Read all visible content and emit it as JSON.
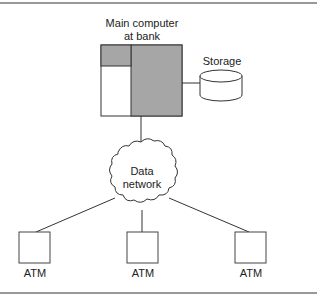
{
  "diagram": {
    "type": "network-topology",
    "nodes": {
      "main_computer": {
        "label_line1": "Main computer",
        "label_line2": "at bank"
      },
      "storage": {
        "label": "Storage"
      },
      "network": {
        "label_line1": "Data",
        "label_line2": "network"
      },
      "atms": [
        {
          "label": "ATM"
        },
        {
          "label": "ATM"
        },
        {
          "label": "ATM"
        }
      ]
    },
    "edges": [
      [
        "main_computer",
        "storage"
      ],
      [
        "main_computer",
        "network"
      ],
      [
        "network",
        "atm_1"
      ],
      [
        "network",
        "atm_2"
      ],
      [
        "network",
        "atm_3"
      ]
    ],
    "colors": {
      "shaded_fill": "#a6a6a6",
      "stroke": "#333333",
      "rule": "#777777"
    }
  }
}
